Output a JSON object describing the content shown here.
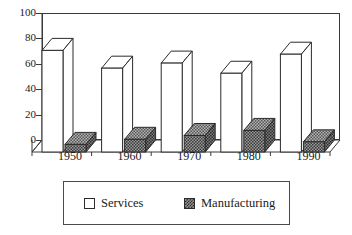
{
  "chart_data": {
    "type": "bar",
    "title": "",
    "subtitle": "",
    "xlabel": "",
    "ylabel": "",
    "categories": [
      "1950",
      "1960",
      "1970",
      "1980",
      "1990"
    ],
    "series": [
      {
        "name": "Services",
        "values": [
          80,
          66,
          70,
          62,
          77
        ],
        "color": "#ffffff",
        "pattern": "solid-white"
      },
      {
        "name": "Manufacturing",
        "values": [
          6,
          10,
          13,
          17,
          8
        ],
        "color": "#8d8d8d",
        "pattern": "checkerboard"
      }
    ],
    "ylim": [
      0,
      100
    ],
    "yticks": [
      0,
      20,
      40,
      60,
      80,
      100
    ],
    "ytick_labels": [
      "0",
      "20",
      "40",
      "60",
      "80",
      "100"
    ],
    "grid": false,
    "legend_position": "bottom",
    "style": "3d-bar"
  },
  "legend": {
    "entries": [
      {
        "label": "Services",
        "swatch": "white-square"
      },
      {
        "label": "Manufacturing",
        "swatch": "checkered-square"
      }
    ]
  },
  "colors": {
    "axis": "#3a3a3a",
    "frame": "#3a3a3a",
    "bar_services_face": "#ffffff",
    "bar_services_top": "#ffffff",
    "bar_services_side": "#f2f2f2",
    "bar_manufacturing_face": "#8d8d8d",
    "bar_manufacturing_top": "#a8a8a8",
    "bar_manufacturing_side": "#707070",
    "outline": "#2b2b2b",
    "background": "#ffffff"
  }
}
